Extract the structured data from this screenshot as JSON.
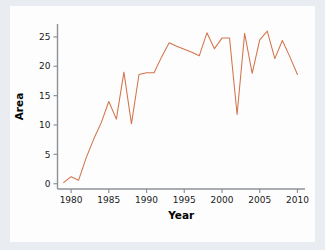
{
  "figure": {
    "background_color": "#e9edf2",
    "canvas_color": "#fdfdfd",
    "axis_color": "#8d9299"
  },
  "chart_data": {
    "type": "line",
    "title": "",
    "xlabel": "Year",
    "ylabel": "Area",
    "xlim": [
      1978.2,
      2011.0
    ],
    "ylim": [
      -0.9,
      27.2
    ],
    "xticks": [
      1980,
      1985,
      1990,
      1995,
      2000,
      2005,
      2010
    ],
    "xtick_labels": [
      "1980",
      "1985",
      "1990",
      "1995",
      "2000",
      "2005",
      "2010"
    ],
    "yticks": [
      0,
      5,
      10,
      15,
      20,
      25
    ],
    "ytick_labels": [
      "0",
      "5",
      "10",
      "15",
      "20",
      "25"
    ],
    "grid": false,
    "legend": false,
    "legend_position": "none",
    "series": [
      {
        "name": "Area",
        "color": "#d2744a",
        "line_width": 1.05,
        "marker": "none",
        "x": [
          1979,
          1980,
          1981,
          1982,
          1983,
          1984,
          1985,
          1986,
          1987,
          1988,
          1989,
          1990,
          1991,
          1992,
          1993,
          1994,
          1995,
          1996,
          1997,
          1998,
          1999,
          2000,
          2001,
          2002,
          2003,
          2004,
          2005,
          2006,
          2007,
          2008,
          2009,
          2010
        ],
        "y": [
          0.2,
          1.2,
          0.6,
          4.4,
          7.6,
          10.4,
          14.0,
          11.0,
          19.0,
          10.2,
          18.6,
          18.9,
          18.9,
          21.6,
          24.0,
          23.4,
          22.9,
          22.4,
          21.8,
          25.7,
          23.0,
          24.8,
          24.8,
          11.8,
          25.6,
          18.8,
          24.5,
          26.0,
          21.3,
          24.4,
          21.6,
          18.6
        ]
      }
    ]
  }
}
